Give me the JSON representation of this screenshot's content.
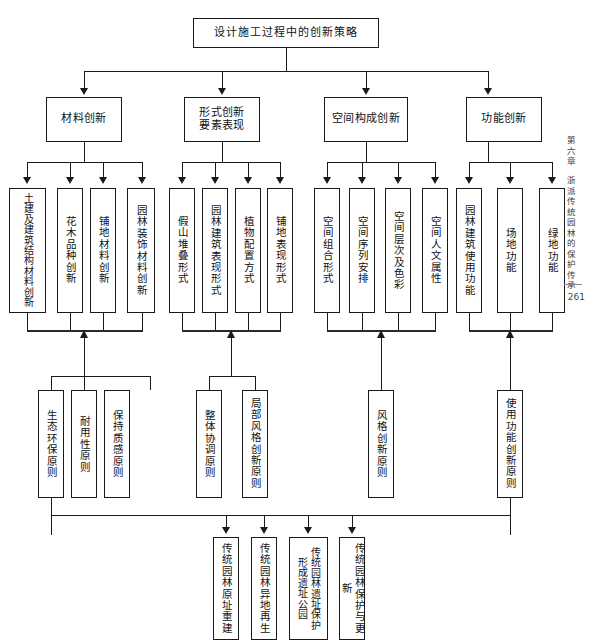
{
  "page": {
    "chapter": "第六章",
    "section": "浙派传统园林的保护传承",
    "page_number": "261"
  },
  "diagram": {
    "title": "设计施工过程中的创新策略",
    "level2": [
      {
        "label": "材料创新"
      },
      {
        "label": "形式创新\n要素表现"
      },
      {
        "label": "空间构成创新"
      },
      {
        "label": "功能创新"
      }
    ],
    "level3": {
      "group_material": [
        {
          "col_right": "土建及建筑结",
          "col_left": "构材料创新",
          "full": "土建及建筑结构材料创新"
        },
        {
          "full": "花木品种创新"
        },
        {
          "full": "铺地材料创新"
        },
        {
          "full": "园林装饰材料创新"
        }
      ],
      "group_form": [
        {
          "full": "假山堆叠形式"
        },
        {
          "full": "园林建筑表现形式"
        },
        {
          "full": "植物配置方式"
        },
        {
          "full": "铺地表现形式"
        }
      ],
      "group_space": [
        {
          "full": "空间组合形式"
        },
        {
          "full": "空间序列安排"
        },
        {
          "full": "空间层次及色彩"
        },
        {
          "full": "空间人文属性"
        }
      ],
      "group_function": [
        {
          "full": "园林建筑使用功能"
        },
        {
          "full": "场地功能"
        },
        {
          "full": "绿地功能"
        }
      ]
    },
    "principles": {
      "material": [
        {
          "full": "生态环保原则"
        },
        {
          "full": "耐用性原则"
        },
        {
          "full": "保持质感原则"
        }
      ],
      "form": [
        {
          "full": "整体协调原则"
        },
        {
          "full": "局部风格创新原则"
        }
      ],
      "space": [
        {
          "full": "风格创新原则"
        }
      ],
      "function": [
        {
          "full": "使用功能创新原则"
        }
      ]
    },
    "outcomes": [
      {
        "full": "传统园林原址重建"
      },
      {
        "full": "传统园林异地再生"
      },
      {
        "col_right": "传统园林遗址保",
        "col_left": "护形成遗址公园",
        "full": "传统园林遗址保护形成遗址公园"
      },
      {
        "full": "传统园林保护与更新"
      }
    ]
  }
}
